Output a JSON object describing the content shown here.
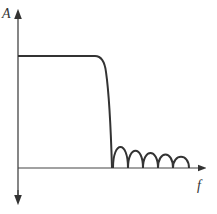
{
  "diagram": {
    "type": "frequency-response",
    "y_axis_label": "A",
    "x_axis_label": "f",
    "colors": {
      "stroke": "#333333",
      "background": "#ffffff"
    },
    "passband_level": "flat",
    "sidelobe_count": 5
  }
}
